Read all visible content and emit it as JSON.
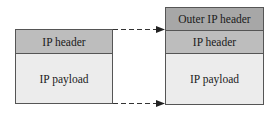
{
  "left_packet": {
    "ip_header": "IP header",
    "ip_payload": "IP payload"
  },
  "right_packet": {
    "outer_ip_header": "Outer IP header",
    "ip_header": "IP header",
    "ip_payload": "IP payload"
  },
  "colors": {
    "outer_header": "#a7a7a7",
    "header": "#bdbdbd",
    "payload": "#ececec",
    "border": "#555555"
  }
}
